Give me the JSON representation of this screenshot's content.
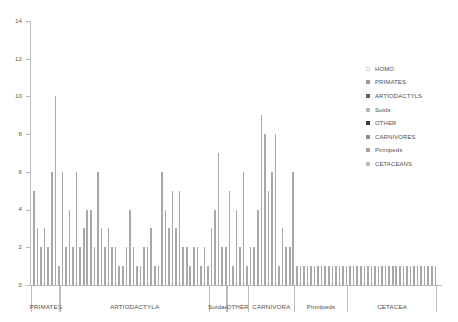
{
  "chart_data": {
    "type": "bar",
    "title": "",
    "xlabel": "",
    "ylabel": "",
    "ylim": [
      0,
      14
    ],
    "ytick_labels": [
      "0",
      "2",
      "4",
      "6",
      "8",
      "10",
      "12",
      "14"
    ],
    "yticks": [
      0,
      2,
      4,
      6,
      8,
      10,
      12,
      14
    ],
    "grid": false,
    "legend_position": "right",
    "bar_color": "#a8a8a8",
    "axis_color": "#b9b9b9",
    "groups": [
      {
        "label": "PRIMATES",
        "values": [
          5,
          3,
          2,
          3,
          2,
          6,
          10,
          1
        ]
      },
      {
        "label": "ARTIODACTYLA",
        "values": [
          6,
          2,
          4,
          2,
          6,
          2,
          3,
          4,
          4,
          2,
          6,
          3,
          2,
          3,
          2,
          2,
          1,
          1,
          2,
          4,
          2,
          1,
          1,
          2,
          2,
          3,
          1,
          1,
          6,
          4,
          3,
          5,
          3,
          5,
          2,
          2,
          1,
          2,
          2,
          1,
          2,
          1
        ]
      },
      {
        "label": "Suidae",
        "values": [
          3,
          4,
          7,
          2,
          2
        ]
      },
      {
        "label": "OTHER",
        "values": [
          5,
          1,
          4,
          2,
          6,
          1
        ]
      },
      {
        "label": "CARNIVORA",
        "values": [
          2,
          2,
          4,
          9,
          8,
          5,
          6,
          8,
          1,
          3,
          2,
          2,
          6
        ]
      },
      {
        "label": "Pinnipeds",
        "values": [
          1,
          1,
          1,
          1,
          1,
          1,
          1,
          1,
          1,
          1,
          1,
          1,
          1,
          1,
          1
        ]
      },
      {
        "label": "CETACEA",
        "values": [
          1,
          1,
          1,
          1,
          1,
          1,
          1,
          1,
          1,
          1,
          1,
          1,
          1,
          1,
          1,
          1,
          1,
          1,
          1,
          1,
          1,
          1,
          1,
          1,
          1
        ]
      }
    ]
  },
  "legend": {
    "items": [
      {
        "label": "HOMO",
        "color": "#ffffff"
      },
      {
        "label": "PRIMATES",
        "color": "#9a9a9a"
      },
      {
        "label": "ARTIODACTYLS",
        "color": "#5e5e5e"
      },
      {
        "label": "Suids",
        "color": "#b4b4b4"
      },
      {
        "label": "OTHER",
        "color": "#3a3a3a"
      },
      {
        "label": "CARNIVORES",
        "color": "#8d8d8d"
      },
      {
        "label": "Pinnipeds",
        "color": "#a2a2a2"
      },
      {
        "label": "CETACEANS",
        "color": "#bdbdbd"
      }
    ]
  }
}
